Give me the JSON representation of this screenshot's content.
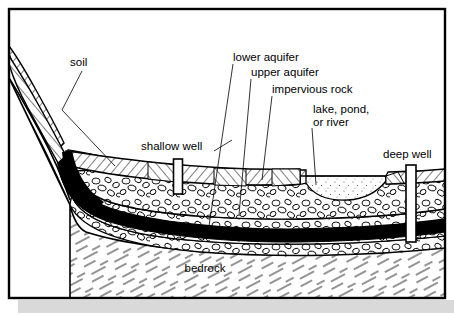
{
  "figure": {
    "frame": {
      "stroke": "#000000",
      "fill": "#ffffff",
      "shadow_color": "#d9d9d9"
    }
  },
  "labels": {
    "soil": "soil",
    "shallow_well": "shallow well",
    "lower_aquifer": "lower aquifer",
    "upper_aquifer": "upper aquifer",
    "impervious_rock": "impervious rock",
    "lake_line1": "lake, pond,",
    "lake_line2": "or river",
    "deep_well": "deep well",
    "bedrock": "bedrock"
  },
  "layers": [
    {
      "name": "soil",
      "pattern": "diagonal-hatch",
      "color": "#ffffff"
    },
    {
      "name": "upper-aquifer",
      "pattern": "gravel-pebbles",
      "color": "#ffffff"
    },
    {
      "name": "impervious-rock",
      "pattern": "solid",
      "color": "#000000"
    },
    {
      "name": "lower-aquifer",
      "pattern": "gravel-pebbles",
      "color": "#ffffff"
    },
    {
      "name": "bedrock",
      "pattern": "dashed-diagonal",
      "color": "#ffffff"
    },
    {
      "name": "lake-water",
      "pattern": "stipple",
      "color": "#ffffff"
    }
  ],
  "wells": [
    {
      "name": "shallow well",
      "x": 178,
      "top": 160,
      "bottom": 193,
      "width": 9
    },
    {
      "name": "deep well",
      "x": 411,
      "top": 166,
      "bottom": 241,
      "width": 10
    }
  ],
  "colors": {
    "ink": "#000000",
    "paper": "#ffffff",
    "shadow": "#d9d9d9"
  }
}
